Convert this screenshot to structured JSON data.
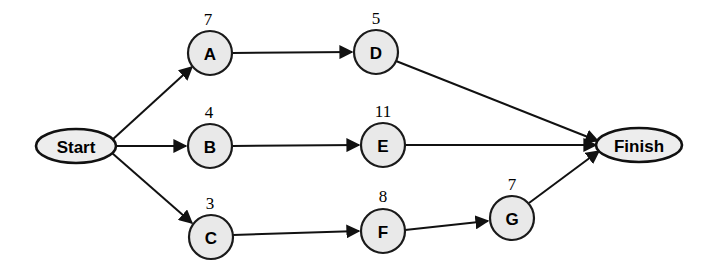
{
  "diagram": {
    "type": "activity-on-node-network",
    "title": "",
    "canvas": {
      "width": 704,
      "height": 277,
      "background": "#ffffff"
    },
    "colors": {
      "node_fill": "#e9e9e9",
      "node_stroke": "#1a1a1a",
      "terminal_fill": "#ededed",
      "terminal_stroke": "#111111",
      "edge_stroke": "#111111",
      "text": "#000000"
    },
    "terminals": [
      {
        "id": "start",
        "label": "Start",
        "cx": 76,
        "cy": 146,
        "rx": 40,
        "ry": 17
      },
      {
        "id": "finish",
        "label": "Finish",
        "cx": 639,
        "cy": 145,
        "rx": 43,
        "ry": 17
      }
    ],
    "nodes": [
      {
        "id": "A",
        "label": "A",
        "duration": "7",
        "cx": 210,
        "cy": 53,
        "r": 22,
        "label_x": 208,
        "label_y": 25
      },
      {
        "id": "D",
        "label": "D",
        "duration": "5",
        "cx": 376,
        "cy": 52,
        "r": 22,
        "label_x": 376,
        "label_y": 24
      },
      {
        "id": "B",
        "label": "B",
        "duration": "4",
        "cx": 210,
        "cy": 146,
        "r": 22,
        "label_x": 209,
        "label_y": 118
      },
      {
        "id": "E",
        "label": "E",
        "duration": "11",
        "cx": 383,
        "cy": 145,
        "r": 22,
        "label_x": 383,
        "label_y": 117
      },
      {
        "id": "C",
        "label": "C",
        "duration": "3",
        "cx": 211,
        "cy": 237,
        "r": 22,
        "label_x": 210,
        "label_y": 209
      },
      {
        "id": "F",
        "label": "F",
        "duration": "8",
        "cx": 383,
        "cy": 231,
        "r": 22,
        "label_x": 383,
        "label_y": 202
      },
      {
        "id": "G",
        "label": "G",
        "duration": "7",
        "cx": 512,
        "cy": 218,
        "r": 22,
        "label_x": 512,
        "label_y": 190
      }
    ],
    "edges": [
      {
        "id": "start-a",
        "from": "start",
        "to": "A",
        "x1": 112,
        "y1": 140,
        "x2": 192,
        "y2": 67
      },
      {
        "id": "start-b",
        "from": "start",
        "to": "B",
        "x1": 117,
        "y1": 146,
        "x2": 186,
        "y2": 146
      },
      {
        "id": "start-c",
        "from": "start",
        "to": "C",
        "x1": 112,
        "y1": 153,
        "x2": 192,
        "y2": 223
      },
      {
        "id": "a-d",
        "from": "A",
        "to": "D",
        "x1": 232,
        "y1": 53,
        "x2": 352,
        "y2": 52
      },
      {
        "id": "b-e",
        "from": "B",
        "to": "E",
        "x1": 232,
        "y1": 146,
        "x2": 359,
        "y2": 145
      },
      {
        "id": "c-f",
        "from": "C",
        "to": "F",
        "x1": 233,
        "y1": 235,
        "x2": 359,
        "y2": 231
      },
      {
        "id": "d-finish",
        "from": "D",
        "to": "Finish",
        "x1": 396,
        "y1": 61,
        "x2": 598,
        "y2": 141
      },
      {
        "id": "e-finish",
        "from": "E",
        "to": "Finish",
        "x1": 405,
        "y1": 145,
        "x2": 596,
        "y2": 145
      },
      {
        "id": "f-g",
        "from": "F",
        "to": "G",
        "x1": 405,
        "y1": 230,
        "x2": 488,
        "y2": 221
      },
      {
        "id": "g-finish",
        "from": "G",
        "to": "Finish",
        "x1": 529,
        "y1": 203,
        "x2": 599,
        "y2": 151
      }
    ]
  }
}
